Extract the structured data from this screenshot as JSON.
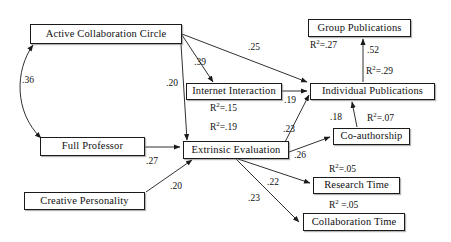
{
  "diagram": {
    "type": "path-diagram",
    "nodes": [
      {
        "id": "active_collaboration_circle",
        "label": "Active Collaboration Circle",
        "x": 30,
        "y": 24,
        "w": 152,
        "h": 20
      },
      {
        "id": "full_professor",
        "label": "Full Professor",
        "x": 40,
        "y": 137,
        "w": 105,
        "h": 19
      },
      {
        "id": "creative_personality",
        "label": "Creative Personality",
        "x": 24,
        "y": 192,
        "w": 121,
        "h": 18
      },
      {
        "id": "internet_interaction",
        "label": "Internet Interaction",
        "x": 186,
        "y": 83,
        "w": 96,
        "h": 17
      },
      {
        "id": "extrinsic_evaluation",
        "label": "Extrinsic Evaluation",
        "x": 183,
        "y": 141,
        "w": 106,
        "h": 18
      },
      {
        "id": "group_publications",
        "label": "Group Publications",
        "x": 308,
        "y": 19,
        "w": 103,
        "h": 18
      },
      {
        "id": "individual_publications",
        "label": "Individual Publications",
        "x": 310,
        "y": 83,
        "w": 125,
        "h": 17
      },
      {
        "id": "co_authorship",
        "label": "Co-authorship",
        "x": 333,
        "y": 128,
        "w": 77,
        "h": 17
      },
      {
        "id": "research_time",
        "label": "Research Time",
        "x": 313,
        "y": 177,
        "w": 87,
        "h": 17
      },
      {
        "id": "collaboration_time",
        "label": "Collaboration Time",
        "x": 303,
        "y": 213,
        "w": 102,
        "h": 18
      }
    ],
    "path_coefficients": [
      {
        "id": "acc_fullprof",
        "from": "active_collaboration_circle",
        "to": "full_professor",
        "value": ".36",
        "bidirectional": true,
        "x": 22,
        "y": 76
      },
      {
        "id": "acc_internet",
        "from": "active_collaboration_circle",
        "to": "internet_interaction",
        "value": ".39",
        "x": 194,
        "y": 58
      },
      {
        "id": "acc_indivpub",
        "from": "active_collaboration_circle",
        "to": "individual_publications",
        "value": ".25",
        "x": 248,
        "y": 43
      },
      {
        "id": "acc_extrinsic",
        "from": "active_collaboration_circle",
        "to": "extrinsic_evaluation",
        "value": ".20",
        "x": 166,
        "y": 79
      },
      {
        "id": "fullprof_extrinsic",
        "from": "full_professor",
        "to": "extrinsic_evaluation",
        "value": ".27",
        "x": 146,
        "y": 157
      },
      {
        "id": "creative_extrinsic",
        "from": "creative_personality",
        "to": "extrinsic_evaluation",
        "value": ".20",
        "x": 170,
        "y": 182
      },
      {
        "id": "internet_indivpub",
        "from": "internet_interaction",
        "to": "individual_publications",
        "value": ".19",
        "x": 284,
        "y": 96
      },
      {
        "id": "extrinsic_indivpub",
        "from": "extrinsic_evaluation",
        "to": "individual_publications",
        "value": ".23",
        "x": 283,
        "y": 125
      },
      {
        "id": "extrinsic_coauthor",
        "from": "extrinsic_evaluation",
        "to": "co_authorship",
        "value": ".26",
        "x": 294,
        "y": 151
      },
      {
        "id": "coauthor_indivpub",
        "from": "co_authorship",
        "to": "individual_publications",
        "value": ".18",
        "x": 330,
        "y": 113
      },
      {
        "id": "indivpub_grouppub",
        "from": "individual_publications",
        "to": "group_publications",
        "value": ".52",
        "x": 367,
        "y": 46
      },
      {
        "id": "extrinsic_researchtime",
        "from": "extrinsic_evaluation",
        "to": "research_time",
        "value": ".22",
        "x": 267,
        "y": 178
      },
      {
        "id": "extrinsic_collabtime",
        "from": "extrinsic_evaluation",
        "to": "collaboration_time",
        "value": ".23",
        "x": 248,
        "y": 194
      }
    ],
    "r_squared_labels": [
      {
        "id": "r2_group_publications",
        "node": "group_publications",
        "prefix": "R",
        "exp": "2",
        "suffix": "=.27",
        "value": 0.27,
        "x": 310,
        "y": 41
      },
      {
        "id": "r2_individual_publications",
        "node": "individual_publications",
        "prefix": "R",
        "exp": "2",
        "suffix": "=.29",
        "value": 0.29,
        "x": 366,
        "y": 67
      },
      {
        "id": "r2_internet_interaction",
        "node": "internet_interaction",
        "prefix": "R",
        "exp": "2",
        "suffix": "=.15",
        "value": 0.15,
        "x": 210,
        "y": 104
      },
      {
        "id": "r2_extrinsic_evaluation",
        "node": "extrinsic_evaluation",
        "prefix": "R",
        "exp": "2",
        "suffix": "=.19",
        "value": 0.19,
        "x": 210,
        "y": 123
      },
      {
        "id": "r2_co_authorship",
        "node": "co_authorship",
        "prefix": "R",
        "exp": "2",
        "suffix": "=.07",
        "value": 0.07,
        "x": 367,
        "y": 114
      },
      {
        "id": "r2_research_time",
        "node": "research_time",
        "prefix": "R",
        "exp": "2",
        "suffix": "=.05",
        "value": 0.05,
        "x": 329,
        "y": 165
      },
      {
        "id": "r2_collaboration_time",
        "node": "collaboration_time",
        "prefix": "R",
        "exp": "2",
        "suffix": " =.05",
        "value": 0.05,
        "x": 329,
        "y": 201
      }
    ],
    "colors": {
      "stroke": "#1a1a1a",
      "text": "#101010",
      "background": "#ffffff",
      "shadow": "#787878"
    }
  }
}
